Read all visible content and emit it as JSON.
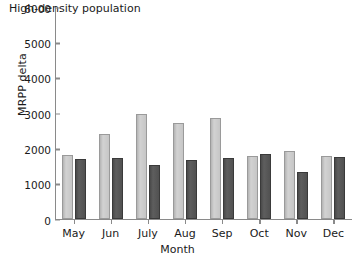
{
  "chart_data": {
    "type": "bar",
    "title": "High-density population",
    "xlabel": "Month",
    "ylabel": "MRPP delta",
    "categories": [
      "May",
      "Jun",
      "July",
      "Aug",
      "Sep",
      "Oct",
      "Nov",
      "Dec"
    ],
    "series": [
      {
        "name": "series-light",
        "color": "#c9c9c9",
        "values": [
          1810,
          2420,
          2960,
          2710,
          2870,
          1790,
          1930,
          1790
        ]
      },
      {
        "name": "series-dark",
        "color": "#555555",
        "values": [
          1700,
          1720,
          1520,
          1680,
          1740,
          1850,
          1330,
          1760
        ]
      }
    ],
    "ylim": [
      0,
      6000
    ],
    "yticks": [
      0,
      1000,
      2000,
      3000,
      4000,
      5000,
      6000
    ],
    "ytick_labels": [
      "0",
      "1000",
      "2000",
      "3000",
      "4000",
      "5000",
      "6000"
    ],
    "grid": false,
    "legend": "none",
    "axis_color": "#8a8a8a"
  }
}
